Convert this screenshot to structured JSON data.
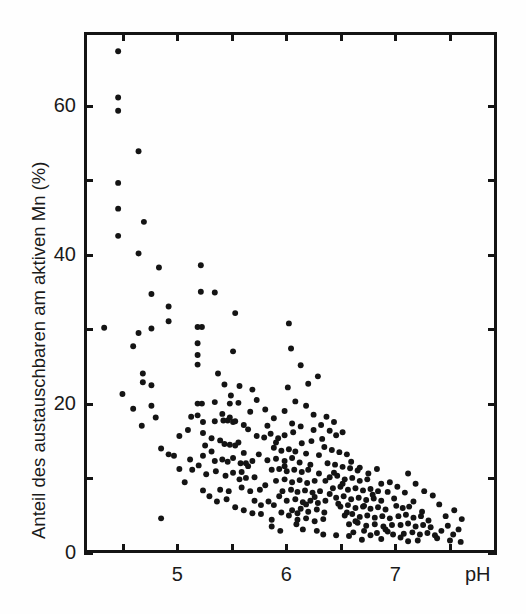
{
  "chart_data": {
    "type": "scatter",
    "title": "",
    "xlabel": "pH",
    "ylabel": "Anteil des austauschbaren am aktiven Mn (%)",
    "xlim": [
      4.14,
      7.93
    ],
    "ylim": [
      0,
      70
    ],
    "grid": false,
    "legend": null,
    "x_ticks": [
      4.5,
      5,
      5.5,
      6,
      6.5,
      7,
      7.5
    ],
    "x_tick_labels": [
      "",
      "5",
      "",
      "6",
      "",
      "7",
      ""
    ],
    "y_ticks": [
      0,
      10,
      20,
      30,
      40,
      50,
      60
    ],
    "y_tick_labels": [
      "0",
      "",
      "20",
      "",
      "40",
      "",
      "60"
    ],
    "marker": "filled-circle",
    "marker_color": "#141414",
    "marker_size_px": 6,
    "n_points": 303,
    "points": [
      [
        4.43,
        67.8
      ],
      [
        4.43,
        61.5
      ],
      [
        4.43,
        59.7
      ],
      [
        4.62,
        54.2
      ],
      [
        4.43,
        49.9
      ],
      [
        4.43,
        46.4
      ],
      [
        4.67,
        44.6
      ],
      [
        4.43,
        42.7
      ],
      [
        4.62,
        40.3
      ],
      [
        4.81,
        38.4
      ],
      [
        5.2,
        38.7
      ],
      [
        4.74,
        34.8
      ],
      [
        4.9,
        33.1
      ],
      [
        4.9,
        31.1
      ],
      [
        4.3,
        30.2
      ],
      [
        4.62,
        29.5
      ],
      [
        4.74,
        30.1
      ],
      [
        4.57,
        27.7
      ],
      [
        5.17,
        30.3
      ],
      [
        5.21,
        30.3
      ],
      [
        5.17,
        28.1
      ],
      [
        5.17,
        26.5
      ],
      [
        5.17,
        25.2
      ],
      [
        5.5,
        27.0
      ],
      [
        4.66,
        24.0
      ],
      [
        4.66,
        22.8
      ],
      [
        4.74,
        22.4
      ],
      [
        4.74,
        19.6
      ],
      [
        5.17,
        19.9
      ],
      [
        5.21,
        19.9
      ],
      [
        5.33,
        20.1
      ],
      [
        5.47,
        19.9
      ],
      [
        5.55,
        20.0
      ],
      [
        5.56,
        22.3
      ],
      [
        5.68,
        21.8
      ],
      [
        5.11,
        18.1
      ],
      [
        5.17,
        18.3
      ],
      [
        5.22,
        17.4
      ],
      [
        5.33,
        17.5
      ],
      [
        5.4,
        18.5
      ],
      [
        5.41,
        17.6
      ],
      [
        5.45,
        17.6
      ],
      [
        5.47,
        18.0
      ],
      [
        5.5,
        17.4
      ],
      [
        5.52,
        17.5
      ],
      [
        4.65,
        16.9
      ],
      [
        4.83,
        13.8
      ],
      [
        5.08,
        16.3
      ],
      [
        5.22,
        15.9
      ],
      [
        5.3,
        15.2
      ],
      [
        5.38,
        14.9
      ],
      [
        5.42,
        14.4
      ],
      [
        5.47,
        14.3
      ],
      [
        5.52,
        14.2
      ],
      [
        5.55,
        14.6
      ],
      [
        5.6,
        13.2
      ],
      [
        5.1,
        12.3
      ],
      [
        5.22,
        12.8
      ],
      [
        5.33,
        12.1
      ],
      [
        5.4,
        12.3
      ],
      [
        5.45,
        12.0
      ],
      [
        5.5,
        12.5
      ],
      [
        5.57,
        11.8
      ],
      [
        5.62,
        11.8
      ],
      [
        5.68,
        12.1
      ],
      [
        5.12,
        10.9
      ],
      [
        5.25,
        10.3
      ],
      [
        5.34,
        10.7
      ],
      [
        5.43,
        10.1
      ],
      [
        5.5,
        10.5
      ],
      [
        5.58,
        10.6
      ],
      [
        5.62,
        9.8
      ],
      [
        5.7,
        9.9
      ],
      [
        5.22,
        8.1
      ],
      [
        5.38,
        8.2
      ],
      [
        5.46,
        8.0
      ],
      [
        5.58,
        8.5
      ],
      [
        5.66,
        8.0
      ],
      [
        5.75,
        8.2
      ],
      [
        5.8,
        8.8
      ],
      [
        4.83,
        4.3
      ],
      [
        5.7,
        6.7
      ],
      [
        5.76,
        6.1
      ],
      [
        5.83,
        6.6
      ],
      [
        5.88,
        6.1
      ],
      [
        5.93,
        7.3
      ],
      [
        5.76,
        4.9
      ],
      [
        5.86,
        4.1
      ],
      [
        5.64,
        16.4
      ],
      [
        5.72,
        15.5
      ],
      [
        5.79,
        15.3
      ],
      [
        5.85,
        15.8
      ],
      [
        5.92,
        15.2
      ],
      [
        5.98,
        15.6
      ],
      [
        5.88,
        13.9
      ],
      [
        5.95,
        13.5
      ],
      [
        6.02,
        13.7
      ],
      [
        6.08,
        13.4
      ],
      [
        5.82,
        12.2
      ],
      [
        5.9,
        12.4
      ],
      [
        5.98,
        12.1
      ],
      [
        6.05,
        12.5
      ],
      [
        6.12,
        11.9
      ],
      [
        5.86,
        10.9
      ],
      [
        5.93,
        11.0
      ],
      [
        6.0,
        10.7
      ],
      [
        6.07,
        10.9
      ],
      [
        6.14,
        10.6
      ],
      [
        6.2,
        10.9
      ],
      [
        5.9,
        9.4
      ],
      [
        5.98,
        9.6
      ],
      [
        6.05,
        9.2
      ],
      [
        6.12,
        9.5
      ],
      [
        6.19,
        9.1
      ],
      [
        6.26,
        9.4
      ],
      [
        5.96,
        8.0
      ],
      [
        6.04,
        8.2
      ],
      [
        6.1,
        7.9
      ],
      [
        6.17,
        8.1
      ],
      [
        6.24,
        7.8
      ],
      [
        6.31,
        8.0
      ],
      [
        6.0,
        6.7
      ],
      [
        6.08,
        6.9
      ],
      [
        6.15,
        6.5
      ],
      [
        6.22,
        6.7
      ],
      [
        6.29,
        6.4
      ],
      [
        6.36,
        6.7
      ],
      [
        6.05,
        5.4
      ],
      [
        6.13,
        5.6
      ],
      [
        6.2,
        5.2
      ],
      [
        6.28,
        5.5
      ],
      [
        6.35,
        5.1
      ],
      [
        6.1,
        4.1
      ],
      [
        6.18,
        4.3
      ],
      [
        6.26,
        3.9
      ],
      [
        6.34,
        4.2
      ],
      [
        6.15,
        2.8
      ],
      [
        6.28,
        2.6
      ],
      [
        5.98,
        18.9
      ],
      [
        6.05,
        17.2
      ],
      [
        6.13,
        16.8
      ],
      [
        6.08,
        20.2
      ],
      [
        6.18,
        19.6
      ],
      [
        6.25,
        18.4
      ],
      [
        6.01,
        22.1
      ],
      [
        6.2,
        22.6
      ],
      [
        6.13,
        25.1
      ],
      [
        6.32,
        17.0
      ],
      [
        6.4,
        16.2
      ],
      [
        6.46,
        15.6
      ],
      [
        6.35,
        14.0
      ],
      [
        6.42,
        13.6
      ],
      [
        6.49,
        13.3
      ],
      [
        6.56,
        13.0
      ],
      [
        6.38,
        11.8
      ],
      [
        6.45,
        11.6
      ],
      [
        6.52,
        11.3
      ],
      [
        6.59,
        11.1
      ],
      [
        6.66,
        10.8
      ],
      [
        6.4,
        9.9
      ],
      [
        6.47,
        10.1
      ],
      [
        6.54,
        9.6
      ],
      [
        6.61,
        9.8
      ],
      [
        6.68,
        9.4
      ],
      [
        6.75,
        9.6
      ],
      [
        6.43,
        8.4
      ],
      [
        6.5,
        8.6
      ],
      [
        6.57,
        8.2
      ],
      [
        6.64,
        8.4
      ],
      [
        6.71,
        8.1
      ],
      [
        6.78,
        8.3
      ],
      [
        6.85,
        8.0
      ],
      [
        6.46,
        7.1
      ],
      [
        6.53,
        7.3
      ],
      [
        6.6,
        6.9
      ],
      [
        6.67,
        7.1
      ],
      [
        6.74,
        6.8
      ],
      [
        6.81,
        7.0
      ],
      [
        6.88,
        6.7
      ],
      [
        6.5,
        5.9
      ],
      [
        6.57,
        6.1
      ],
      [
        6.64,
        5.7
      ],
      [
        6.71,
        5.9
      ],
      [
        6.78,
        5.6
      ],
      [
        6.85,
        5.8
      ],
      [
        6.92,
        5.5
      ],
      [
        6.54,
        4.7
      ],
      [
        6.61,
        4.9
      ],
      [
        6.68,
        4.5
      ],
      [
        6.75,
        4.7
      ],
      [
        6.82,
        4.4
      ],
      [
        6.89,
        4.6
      ],
      [
        6.96,
        4.3
      ],
      [
        6.58,
        3.5
      ],
      [
        6.66,
        3.7
      ],
      [
        6.74,
        3.3
      ],
      [
        6.82,
        3.5
      ],
      [
        6.9,
        3.2
      ],
      [
        6.98,
        3.4
      ],
      [
        6.62,
        2.4
      ],
      [
        6.72,
        2.6
      ],
      [
        6.84,
        2.3
      ],
      [
        6.94,
        2.5
      ],
      [
        6.7,
        1.4
      ],
      [
        6.88,
        1.5
      ],
      [
        7.02,
        6.0
      ],
      [
        7.08,
        5.7
      ],
      [
        7.14,
        5.9
      ],
      [
        7.04,
        4.6
      ],
      [
        7.11,
        4.8
      ],
      [
        7.18,
        4.4
      ],
      [
        7.25,
        4.6
      ],
      [
        7.06,
        3.4
      ],
      [
        7.13,
        3.6
      ],
      [
        7.2,
        3.2
      ],
      [
        7.27,
        3.4
      ],
      [
        7.34,
        3.1
      ],
      [
        7.09,
        2.2
      ],
      [
        7.17,
        2.4
      ],
      [
        7.24,
        2.1
      ],
      [
        7.31,
        2.3
      ],
      [
        7.38,
        2.0
      ],
      [
        7.13,
        1.2
      ],
      [
        7.22,
        1.3
      ],
      [
        7.44,
        2.6
      ],
      [
        7.5,
        3.3
      ],
      [
        7.55,
        2.1
      ],
      [
        7.6,
        2.8
      ],
      [
        7.48,
        4.6
      ],
      [
        7.56,
        5.4
      ],
      [
        7.63,
        4.2
      ],
      [
        7.42,
        6.2
      ],
      [
        7.36,
        7.4
      ],
      [
        7.28,
        8.0
      ],
      [
        7.2,
        9.0
      ],
      [
        7.13,
        10.4
      ],
      [
        7.03,
        8.6
      ],
      [
        6.96,
        9.2
      ],
      [
        7.4,
        1.6
      ],
      [
        7.52,
        1.3
      ],
      [
        7.62,
        1.1
      ],
      [
        5.52,
        32.2
      ],
      [
        5.33,
        35.0
      ],
      [
        5.2,
        35.1
      ],
      [
        4.47,
        21.2
      ],
      [
        4.57,
        19.2
      ],
      [
        6.04,
        27.4
      ],
      [
        6.29,
        23.6
      ],
      [
        6.02,
        30.8
      ],
      [
        6.23,
        14.8
      ],
      [
        6.3,
        12.9
      ],
      [
        6.37,
        18.1
      ],
      [
        6.44,
        17.4
      ],
      [
        6.52,
        16.0
      ],
      [
        6.18,
        13.1
      ],
      [
        6.25,
        16.3
      ],
      [
        6.33,
        15.1
      ],
      [
        5.72,
        20.4
      ],
      [
        5.8,
        19.1
      ],
      [
        5.88,
        17.9
      ],
      [
        5.66,
        18.8
      ],
      [
        5.6,
        17.0
      ],
      [
        5.48,
        21.0
      ],
      [
        5.42,
        22.5
      ],
      [
        5.36,
        24.0
      ],
      [
        5.3,
        13.4
      ],
      [
        5.24,
        14.2
      ],
      [
        5.18,
        11.5
      ],
      [
        5.05,
        9.2
      ],
      [
        5.0,
        11.0
      ],
      [
        4.95,
        12.8
      ],
      [
        5.28,
        7.3
      ],
      [
        5.35,
        6.6
      ],
      [
        5.44,
        6.9
      ],
      [
        5.52,
        5.8
      ],
      [
        5.6,
        5.4
      ],
      [
        5.68,
        5.0
      ],
      [
        5.95,
        5.1
      ],
      [
        6.02,
        4.7
      ],
      [
        6.09,
        3.5
      ],
      [
        6.4,
        7.6
      ],
      [
        6.48,
        6.3
      ],
      [
        6.56,
        5.1
      ],
      [
        6.64,
        3.9
      ],
      [
        6.72,
        6.0
      ],
      [
        6.8,
        7.5
      ],
      [
        6.88,
        9.0
      ],
      [
        6.94,
        7.9
      ],
      [
        7.0,
        7.0
      ],
      [
        6.3,
        10.4
      ],
      [
        6.22,
        11.6
      ],
      [
        6.14,
        14.5
      ],
      [
        6.06,
        16.0
      ],
      [
        5.98,
        11.4
      ],
      [
        5.9,
        14.6
      ],
      [
        5.82,
        16.9
      ],
      [
        5.74,
        13.0
      ],
      [
        5.64,
        11.4
      ],
      [
        5.56,
        9.6
      ],
      [
        6.6,
        12.0
      ],
      [
        6.68,
        11.2
      ],
      [
        6.76,
        10.4
      ],
      [
        6.84,
        11.0
      ],
      [
        6.44,
        10.5
      ],
      [
        6.36,
        9.4
      ],
      [
        6.52,
        9.0
      ],
      [
        6.26,
        7.2
      ],
      [
        6.18,
        6.2
      ],
      [
        6.1,
        5.0
      ],
      [
        7.32,
        4.0
      ],
      [
        7.26,
        5.2
      ],
      [
        7.18,
        6.6
      ],
      [
        7.1,
        7.8
      ],
      [
        6.99,
        2.1
      ],
      [
        6.92,
        2.8
      ],
      [
        5.86,
        3.2
      ],
      [
        5.94,
        2.6
      ],
      [
        6.34,
        2.1
      ],
      [
        6.46,
        2.0
      ],
      [
        6.58,
        1.9
      ],
      [
        6.78,
        2.0
      ],
      [
        7.06,
        1.7
      ],
      [
        4.9,
        13.0
      ],
      [
        5.0,
        15.5
      ],
      [
        4.78,
        18.0
      ]
    ]
  },
  "axes": {
    "x_label_text": "pH",
    "y_label_text": "Anteil des austauschbaren am aktiven Mn (%)",
    "x_visible_labels": [
      {
        "value": 5,
        "text": "5"
      },
      {
        "value": 6,
        "text": "6"
      },
      {
        "value": 7,
        "text": "7"
      }
    ],
    "y_visible_labels": [
      {
        "value": 0,
        "text": "0"
      },
      {
        "value": 20,
        "text": "20"
      },
      {
        "value": 40,
        "text": "40"
      },
      {
        "value": 60,
        "text": "60"
      }
    ]
  },
  "colors": {
    "background": "#fefefe",
    "axis": "#141414",
    "marker": "#141414",
    "text": "#1a1a1a"
  }
}
